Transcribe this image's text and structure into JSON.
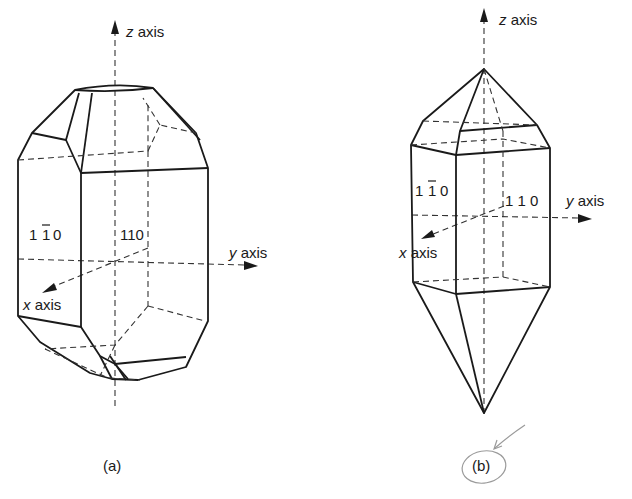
{
  "figure": {
    "panel_a": {
      "caption": "(a)",
      "axes": {
        "z": "z",
        "y": "y",
        "x": "x",
        "suffix": "axis"
      },
      "faces": [
        {
          "label": "1 1 0",
          "bar_on": "middle",
          "display": "1̅1̅0"
        },
        {
          "label": "110"
        }
      ]
    },
    "panel_b": {
      "caption": "(b)",
      "axes": {
        "z": "z",
        "y": "y",
        "x": "x",
        "suffix": "axis"
      },
      "faces": [
        {
          "label": "1 1 0",
          "bar_on": "middle"
        },
        {
          "label": "1 1 0"
        }
      ]
    },
    "text": {
      "a_z": "z",
      "a_y": "y",
      "a_x": "x",
      "axis": "axis",
      "a_face_left_1": "1",
      "a_face_left_2": "1",
      "a_face_left_3": "0",
      "a_face_right": "110",
      "b_face_left_1": "1",
      "b_face_left_2": "1",
      "b_face_left_3": "0",
      "b_face_right": "1 1 0",
      "cap_a": "(a)",
      "cap_b": "(b)"
    },
    "annotation": {
      "handwritten_circle_around": "(b)",
      "color": "#9a9a9a"
    }
  }
}
